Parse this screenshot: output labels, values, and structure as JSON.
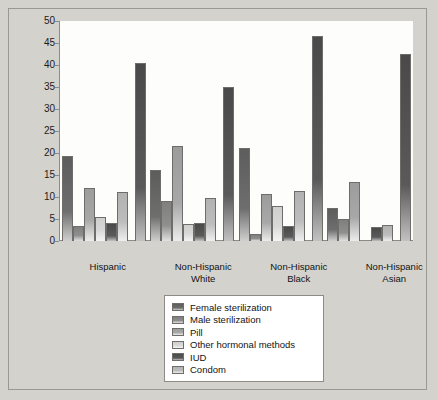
{
  "chart_data": {
    "type": "bar",
    "title": "",
    "xlabel": "",
    "ylabel": "",
    "ylim": [
      0,
      50
    ],
    "yticks": [
      0,
      5,
      10,
      15,
      20,
      25,
      30,
      35,
      40,
      45,
      50
    ],
    "grid": false,
    "legend_position": "bottom-center",
    "categories": [
      "Hispanic",
      "Non-Hispanic White",
      "Non-Hispanic Black",
      "Non-Hispanic Asian"
    ],
    "category_lines": [
      [
        "Hispanic"
      ],
      [
        "Non-Hispanic",
        "White"
      ],
      [
        "Non-Hispanic",
        "Black"
      ],
      [
        "Non-Hispanic",
        "Asian"
      ]
    ],
    "series": [
      {
        "name": "Female sterilization",
        "color": "#5d5d5d",
        "values": [
          19.3,
          16.1,
          21.1,
          7.5
        ]
      },
      {
        "name": "Male sterilization",
        "color": "#7f7f7f",
        "values": [
          3.4,
          9.2,
          1.5,
          4.9
        ]
      },
      {
        "name": "Pill",
        "color": "#9c9c9c",
        "values": [
          12.1,
          21.7,
          10.6,
          13.3
        ]
      },
      {
        "name": "Other hormonal methods",
        "color": "#cfcfcf",
        "values": [
          5.5,
          3.9,
          7.9,
          0.0
        ]
      },
      {
        "name": "IUD",
        "color": "#4a4a4a",
        "values": [
          4.2,
          4.0,
          3.3,
          3.2
        ]
      },
      {
        "name": "Condom",
        "color": "#b2b2b2",
        "values": [
          11.1,
          9.7,
          11.3,
          3.7
        ]
      },
      {
        "name": "Any method",
        "color": "#4a4a4a",
        "values": [
          40.5,
          34.9,
          46.5,
          42.6
        ]
      }
    ]
  },
  "legend": {
    "items": [
      {
        "label": "Female sterilization"
      },
      {
        "label": "Male sterilization"
      },
      {
        "label": "Pill"
      },
      {
        "label": "Other hormonal methods"
      },
      {
        "label": "IUD"
      },
      {
        "label": "Condom"
      }
    ]
  }
}
